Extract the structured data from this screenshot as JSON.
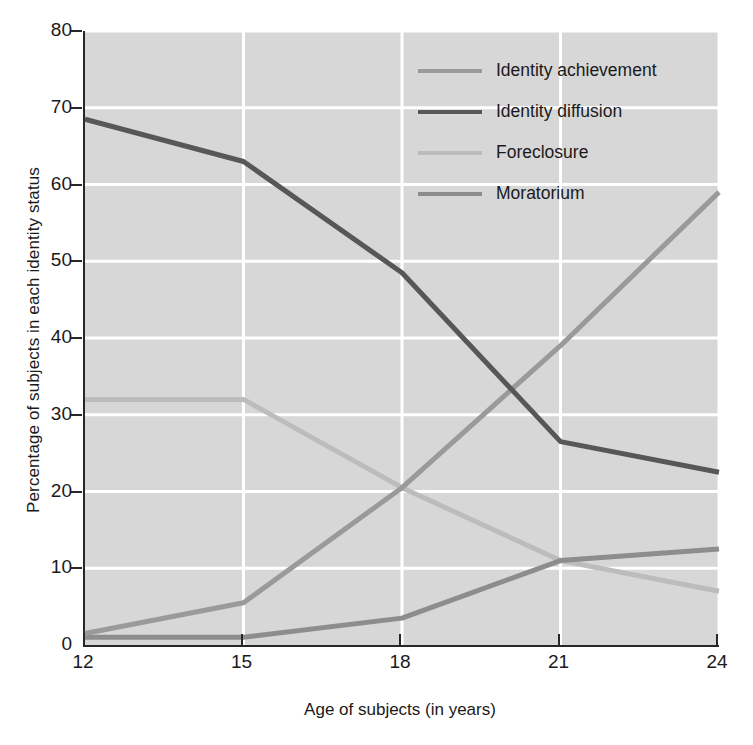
{
  "chart_data": {
    "type": "line",
    "title": "",
    "xlabel": "Age of subjects (in years)",
    "ylabel": "Percentage of subjects in each identity status",
    "x": [
      12,
      15,
      18,
      21,
      24
    ],
    "xtick_labels": [
      "12",
      "15",
      "18",
      "21",
      "24"
    ],
    "ytick_labels": [
      "0",
      "10",
      "20",
      "30",
      "40",
      "50",
      "60",
      "70",
      "80"
    ],
    "yticks": [
      0,
      10,
      20,
      30,
      40,
      50,
      60,
      70,
      80
    ],
    "xlim": [
      12,
      24
    ],
    "ylim": [
      0,
      80
    ],
    "grid": true,
    "legend_position": "upper-right-inside",
    "plot_background": "#d7d7d7",
    "grid_color": "#ffffff",
    "axis_color": "#272727",
    "series": [
      {
        "name": "Identity achievement",
        "color": "#9a9a9a",
        "values": [
          1.5,
          5.5,
          20.5,
          39.0,
          59.0
        ]
      },
      {
        "name": "Identity diffusion",
        "color": "#575757",
        "values": [
          68.5,
          63.0,
          48.5,
          26.5,
          22.5
        ]
      },
      {
        "name": "Foreclosure",
        "color": "#bcbcbc",
        "values": [
          32.0,
          32.0,
          20.5,
          11.0,
          7.0
        ]
      },
      {
        "name": "Moratorium",
        "color": "#8d8d8d",
        "values": [
          1.0,
          1.0,
          3.5,
          11.0,
          12.5
        ]
      }
    ]
  }
}
